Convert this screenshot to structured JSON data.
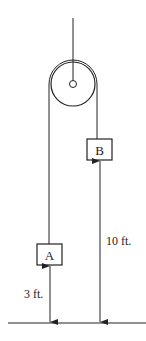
{
  "diagram": {
    "type": "pulley-system",
    "line_color": "#222222",
    "background": "#ffffff",
    "blocks": [
      {
        "id": "A",
        "label": "A",
        "height_above_ground": "3 ft."
      },
      {
        "id": "B",
        "label": "B",
        "height_above_ground": "10 ft."
      }
    ],
    "dimensions": {
      "a_label": "3 ft.",
      "b_label": "10 ft."
    },
    "components": [
      "ceiling-support",
      "pulley",
      "rope",
      "block-A",
      "block-B",
      "ground"
    ]
  }
}
